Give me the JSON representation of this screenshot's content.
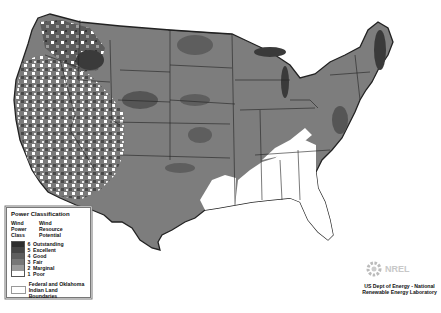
{
  "map": {
    "title": "US Wind Resource Map",
    "region": "Contiguous United States",
    "colors": {
      "class6": "#2e2e2e",
      "class5": "#454545",
      "class4": "#5e5e5e",
      "class3": "#777777",
      "class2": "#9a9a9a",
      "class1": "#ffffff",
      "border": "#222222"
    }
  },
  "legend": {
    "title": "Power Classification",
    "col1_header": "Wind Power Class",
    "col2_header": "Wind Resource Potential",
    "col1_l1": "Wind",
    "col1_l2": "Power",
    "col1_l3": "Class",
    "col2_l1": "Wind",
    "col2_l2": "Resource",
    "col2_l3": "Potential",
    "classes": [
      {
        "num": "6",
        "label": "Outstanding"
      },
      {
        "num": "5",
        "label": "Excellent"
      },
      {
        "num": "4",
        "label": "Good"
      },
      {
        "num": "3",
        "label": "Fair"
      },
      {
        "num": "2",
        "label": "Marginal"
      },
      {
        "num": "1",
        "label": "Poor"
      }
    ],
    "boundary_label_1": "Federal and Oklahoma",
    "boundary_label_2": "Indian Land Boundaries"
  },
  "credit": {
    "line1": "US Dept of Energy - National",
    "line2": "Renewable Energy Laboratory",
    "logo_text": "NREL"
  }
}
